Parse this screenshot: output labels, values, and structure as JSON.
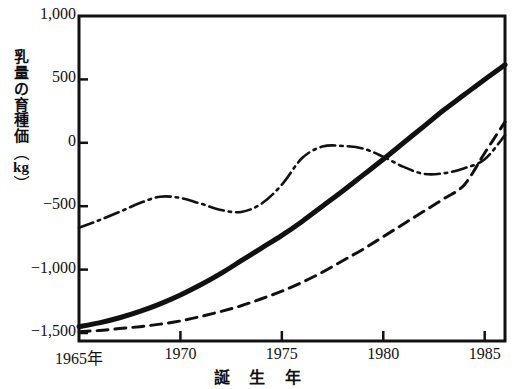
{
  "chart_data": {
    "type": "line",
    "title": "",
    "xlabel": "誕 生 年",
    "ylabel": "乳量の育種価（kg）",
    "xlim": [
      1965,
      1986
    ],
    "ylim": [
      -1500,
      1000
    ],
    "xticks": [
      1965,
      1970,
      1975,
      1980,
      1985
    ],
    "xtick_labels": [
      "1965年",
      "1970",
      "1975",
      "1980",
      "1985"
    ],
    "yticks": [
      1000,
      500,
      0,
      -500,
      -1000,
      -1500
    ],
    "ytick_labels": [
      "1,000",
      "500",
      "0",
      "−500",
      "−1,000",
      "−1,500"
    ],
    "grid": false,
    "legend": "none",
    "x": [
      1965,
      1966,
      1967,
      1968,
      1969,
      1970,
      1971,
      1972,
      1973,
      1974,
      1975,
      1976,
      1977,
      1978,
      1979,
      1980,
      1981,
      1982,
      1983,
      1984,
      1985,
      1986
    ],
    "series": [
      {
        "name": "solid-thick",
        "style": "solid",
        "width": 5,
        "color": "#111111",
        "values": [
          -1450,
          -1420,
          -1380,
          -1330,
          -1270,
          -1200,
          -1120,
          -1030,
          -930,
          -830,
          -730,
          -620,
          -500,
          -380,
          -255,
          -130,
          0,
          130,
          260,
          380,
          500,
          615
        ]
      },
      {
        "name": "dashed",
        "style": "dashed",
        "width": 3,
        "color": "#111111",
        "values": [
          -1490,
          -1480,
          -1465,
          -1450,
          -1430,
          -1405,
          -1370,
          -1330,
          -1285,
          -1230,
          -1170,
          -1100,
          -1020,
          -930,
          -840,
          -740,
          -640,
          -540,
          -440,
          -330,
          -80,
          165
        ]
      },
      {
        "name": "dash-dot",
        "style": "dashdot",
        "width": 2.6,
        "color": "#111111",
        "values": [
          -670,
          -610,
          -545,
          -475,
          -425,
          -435,
          -480,
          -530,
          -545,
          -480,
          -330,
          -120,
          -30,
          -25,
          -45,
          -110,
          -190,
          -245,
          -240,
          -200,
          -130,
          60
        ]
      }
    ]
  },
  "axis": {
    "frame_color": "#111111"
  }
}
